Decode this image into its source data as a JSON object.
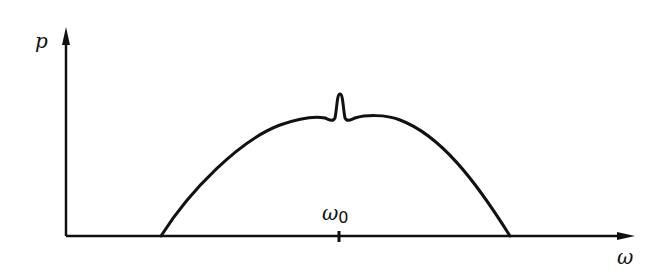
{
  "diagram": {
    "y_axis_label": "p",
    "x_axis_label": "ω",
    "center_tick_label": "ω",
    "center_tick_subscript": "0",
    "colors": {
      "line": "#111111",
      "background": "#ffffff"
    }
  }
}
